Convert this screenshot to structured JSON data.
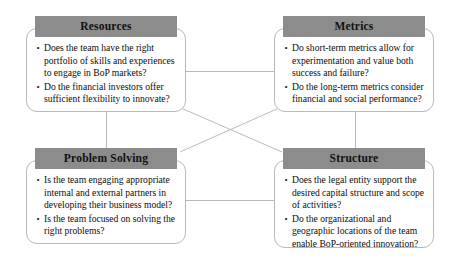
{
  "diagram": {
    "type": "four-quadrant-framework",
    "connector_color": "#b9b9b9",
    "header_color": "#8c8c8c",
    "box_border_color": "#b9b9b9",
    "background_color": "#ffffff",
    "nodes": [
      {
        "id": "resources",
        "title": "Resources",
        "position": "top-left",
        "bullet": "•",
        "items": [
          "Does the team have the right portfolio of skills and experiences to engage in BoP markets?",
          "Do the financial investors offer sufficient flexibility to innovate?"
        ]
      },
      {
        "id": "metrics",
        "title": "Metrics",
        "position": "top-right",
        "bullet": "•",
        "items": [
          "Do short-term metrics allow for experimentation and value both success and failure?",
          "Do the long-term metrics consider financial and social performance?"
        ]
      },
      {
        "id": "problem-solving",
        "title": "Problem Solving",
        "position": "bottom-left",
        "bullet": "•",
        "items": [
          "Is the team engaging appropriate internal and external partners in developing their business model?",
          "Is the team focused on solving the right problems?"
        ]
      },
      {
        "id": "structure",
        "title": "Structure",
        "position": "bottom-right",
        "bullet": "•",
        "items": [
          "Does the legal entity support the desired capital structure and scope of activities?",
          "Do the organizational and geographic locations of the team enable BoP-oriented innovation?"
        ]
      }
    ],
    "connections": [
      {
        "from": "resources",
        "to": "metrics",
        "style": "horizontal"
      },
      {
        "from": "problem-solving",
        "to": "structure",
        "style": "horizontal"
      },
      {
        "from": "resources",
        "to": "problem-solving",
        "style": "vertical"
      },
      {
        "from": "metrics",
        "to": "structure",
        "style": "vertical"
      },
      {
        "from": "resources",
        "to": "structure",
        "style": "diagonal"
      },
      {
        "from": "metrics",
        "to": "problem-solving",
        "style": "diagonal"
      }
    ]
  }
}
